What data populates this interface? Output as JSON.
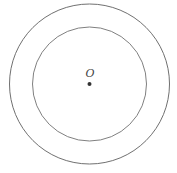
{
  "diagram": {
    "center": {
      "x": 89.5,
      "y": 84
    },
    "outer_circle": {
      "r": 80,
      "stroke": "#707070"
    },
    "inner_circle": {
      "r": 57,
      "stroke": "#808080"
    },
    "center_point": {
      "r": 2,
      "fill": "#333333"
    },
    "center_label": "O",
    "label_color": "#444444"
  }
}
